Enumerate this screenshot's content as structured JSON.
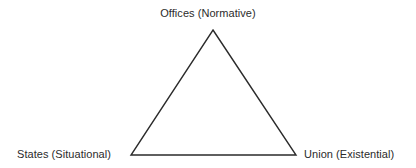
{
  "diagram": {
    "type": "triangle",
    "background_color": "#ffffff",
    "stroke_color": "#2b2b2b",
    "text_color": "#2b2b2b",
    "vertices": [
      {
        "id": "apex",
        "label": "Offices (Normative)",
        "term": "Offices",
        "qualifier": "Normative",
        "x": 213,
        "y": 30,
        "label_position": "above"
      },
      {
        "id": "bottom-left",
        "label": "States (Situational)",
        "term": "States",
        "qualifier": "Situational",
        "x": 131,
        "y": 155,
        "label_position": "left"
      },
      {
        "id": "bottom-right",
        "label": "Union (Existential)",
        "term": "Union",
        "qualifier": "Existential",
        "x": 296,
        "y": 155,
        "label_position": "right"
      }
    ],
    "edges": [
      {
        "id": "left-edge",
        "from": "bottom-left",
        "to": "apex"
      },
      {
        "id": "right-edge",
        "from": "apex",
        "to": "bottom-right"
      },
      {
        "id": "base-edge",
        "from": "bottom-left",
        "to": "bottom-right"
      }
    ]
  }
}
